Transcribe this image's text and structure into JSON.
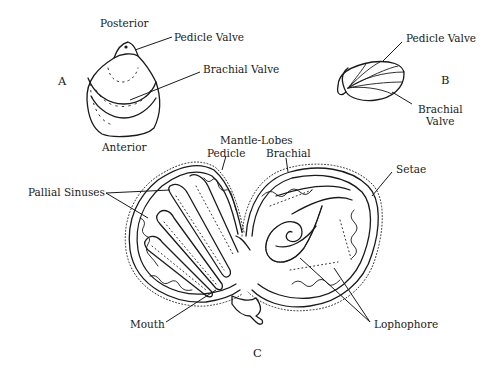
{
  "figure": {
    "panels": [
      {
        "id": "A",
        "label": "A",
        "orientation_labels": {
          "top": "Posterior",
          "bottom": "Anterior"
        },
        "callouts": [
          "Pedicle Valve",
          "Brachial Valve"
        ]
      },
      {
        "id": "B",
        "label": "B",
        "callouts": [
          "Pedicle  Valve",
          "Brachial",
          "Valve"
        ]
      },
      {
        "id": "C",
        "label": "C",
        "header": "Mantle-Lobes",
        "callouts": [
          "Pedicle",
          "Brachial",
          "Setae",
          "Pallial Sinuses",
          "Mouth",
          "Lophophore"
        ]
      }
    ]
  },
  "labels": {
    "a_panel": "A",
    "a_posterior": "Posterior",
    "a_anterior": "Anterior",
    "a_pedicle_valve": "Pedicle Valve",
    "a_brachial_valve": "Brachial Valve",
    "b_panel": "B",
    "b_pedicle_valve": "Pedicle  Valve",
    "b_brachial": "Brachial",
    "b_valve": "Valve",
    "c_panel": "C",
    "c_mantle_lobes": "Mantle-Lobes",
    "c_pedicle": "Pedicle",
    "c_brachial": "Brachial",
    "c_setae": "Setae",
    "c_pallial_sinuses": "Pallial Sinuses",
    "c_mouth": "Mouth",
    "c_lophophore": "Lophophore"
  },
  "colors": {
    "ink": "#1a1a1a",
    "paper": "#ffffff"
  }
}
